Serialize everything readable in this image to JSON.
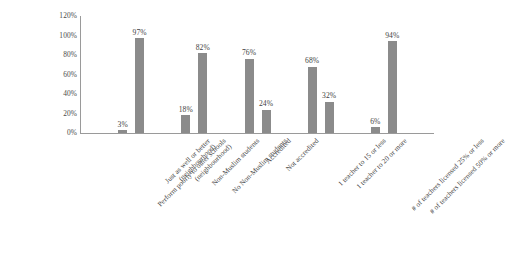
{
  "chart_data": {
    "type": "bar",
    "title": "",
    "xlabel": "",
    "ylabel": "",
    "ylim": [
      0,
      120
    ],
    "grid": false,
    "legend": "none",
    "y_ticks": [
      "0%",
      "20%",
      "40%",
      "60%",
      "80%",
      "100%",
      "120%"
    ],
    "y_tick_values": [
      0,
      20,
      40,
      60,
      80,
      100,
      120
    ],
    "bar_color": "#8b8b8b",
    "axis_color": "#9a9a9a",
    "background": "#ffffff",
    "categories": [
      "Perform poorly to other schools (neighbourhood)",
      "Just as well or better (neighbourhood)",
      "Non-Muslim students",
      "No Non-Muslim students",
      "Accredited",
      "Not accredited",
      "1 teacher to 15 or less",
      "1 teacher to 20 or more",
      "# of teachers licensed 25% or less",
      "# of teachers licensed 50% or more"
    ],
    "category_lines": [
      [
        "Perform poorly to other schools",
        "(neighbourhood)"
      ],
      [
        "Just as well or better",
        "(neighbourhood)"
      ],
      [
        "Non-Muslim students",
        ""
      ],
      [
        "No Non-Muslim students",
        ""
      ],
      [
        "Accredited",
        ""
      ],
      [
        "Not accredited",
        ""
      ],
      [
        "1 teacher to 15 or less",
        ""
      ],
      [
        "1 teacher to 20 or more",
        ""
      ],
      [
        "# of teachers licensed 25% or less",
        ""
      ],
      [
        "# of teachers licensed 50% or more",
        ""
      ]
    ],
    "values": [
      3,
      97,
      18,
      82,
      76,
      24,
      68,
      32,
      6,
      94
    ],
    "value_labels": [
      "3%",
      "97%",
      "18%",
      "82%",
      "76%",
      "24%",
      "68%",
      "32%",
      "6%",
      "94%"
    ]
  }
}
